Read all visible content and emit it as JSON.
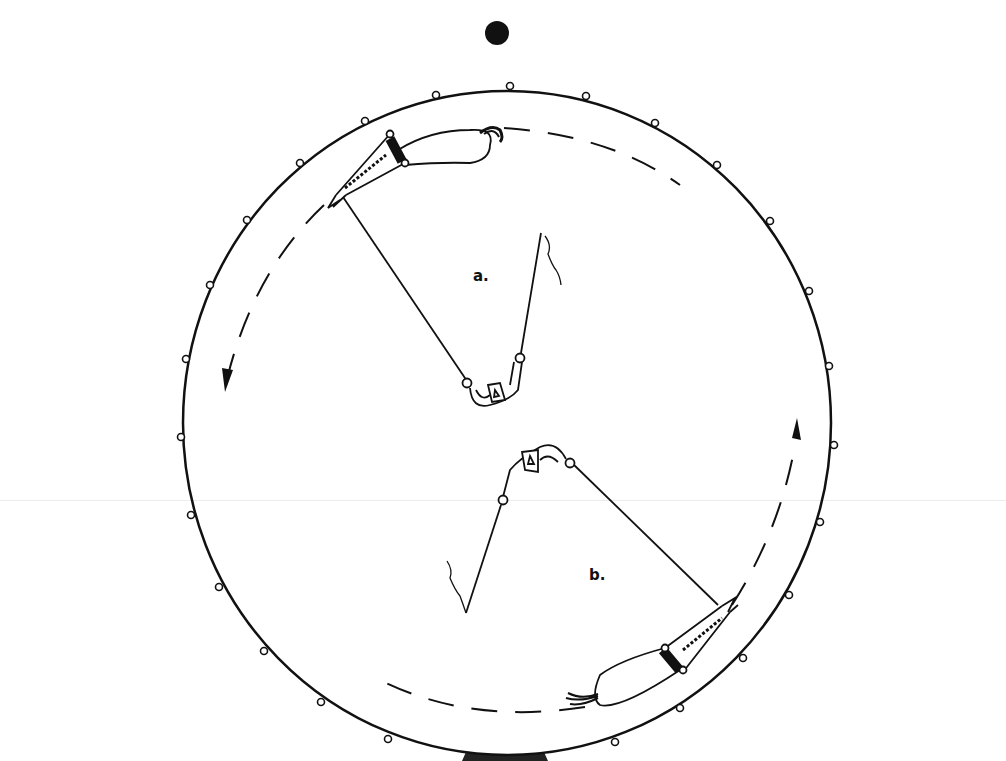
{
  "figure": {
    "type": "line-drawing",
    "colors": {
      "ink": "#111111",
      "background": "#ffffff"
    }
  },
  "labels": {
    "a": "a.",
    "b": "b."
  },
  "elements": {
    "top_marker": "filled-dot",
    "arena": "circle-with-rim-rings",
    "arrow_a_direction": "counter-clockwise (down on left side)",
    "arrow_b_direction": "counter-clockwise (up on right side)",
    "rim_ring_count": 26
  }
}
